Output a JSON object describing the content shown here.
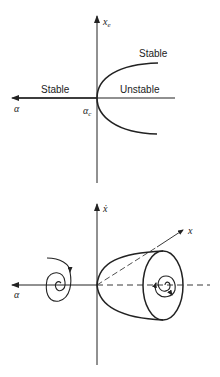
{
  "top_diagram": {
    "title": "Bifurcation diagram",
    "vertical_axis_label": "x",
    "vertical_axis_subscript": "e",
    "horizontal_axis_label": "α",
    "critical_point_label": "α",
    "critical_point_subscript": "c",
    "region_labels": {
      "left": "Stable",
      "upper_branch": "Stable",
      "middle": "Unstable"
    }
  },
  "bottom_diagram": {
    "title": "Phase space (Hopf bifurcation)",
    "vertical_axis_label": "ẋ",
    "depth_axis_label": "x",
    "horizontal_axis_label": "α"
  },
  "colors": {
    "ink": "#222222",
    "background": "#ffffff"
  }
}
